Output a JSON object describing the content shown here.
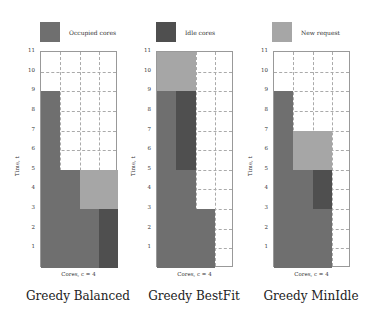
{
  "colors": {
    "occupied": "#6f6f6f",
    "idle": "#4f4f4f",
    "new_request": "#a6a6a6",
    "grid": "#aaaaaa"
  },
  "legend": [
    {
      "key": "occupied",
      "label": "Occupied cores"
    },
    {
      "key": "idle",
      "label": "Idle cores"
    },
    {
      "key": "new_request",
      "label": "New request"
    }
  ],
  "axes": {
    "y_ticks": [
      "1",
      "2",
      "3",
      "4",
      "5",
      "6",
      "7",
      "8",
      "9",
      "10",
      "11"
    ],
    "y_label": "Time, t",
    "x_label": "Cores, c = 4",
    "y_range": [
      0,
      11
    ],
    "cores": 4
  },
  "charts": [
    {
      "title": "Greedy Balanced",
      "blocks": [
        {
          "type": "occupied",
          "core": 1,
          "from": 0,
          "to": 9
        },
        {
          "type": "occupied",
          "core": 2,
          "from": 0,
          "to": 5
        },
        {
          "type": "occupied",
          "core": 3,
          "from": 0,
          "to": 3
        },
        {
          "type": "idle",
          "core": 4,
          "from": 0,
          "to": 3
        },
        {
          "type": "new_request",
          "core": 3,
          "from": 3,
          "to": 5
        },
        {
          "type": "new_request",
          "core": 4,
          "from": 3,
          "to": 5
        }
      ]
    },
    {
      "title": "Greedy BestFit",
      "blocks": [
        {
          "type": "occupied",
          "core": 1,
          "from": 0,
          "to": 9
        },
        {
          "type": "occupied",
          "core": 2,
          "from": 0,
          "to": 5
        },
        {
          "type": "idle",
          "core": 2,
          "from": 5,
          "to": 9
        },
        {
          "type": "occupied",
          "core": 3,
          "from": 0,
          "to": 3
        },
        {
          "type": "new_request",
          "core": 1,
          "from": 9,
          "to": 11
        },
        {
          "type": "new_request",
          "core": 2,
          "from": 9,
          "to": 11
        }
      ]
    },
    {
      "title": "Greedy MinIdle",
      "blocks": [
        {
          "type": "occupied",
          "core": 1,
          "from": 0,
          "to": 9
        },
        {
          "type": "occupied",
          "core": 2,
          "from": 0,
          "to": 5
        },
        {
          "type": "occupied",
          "core": 3,
          "from": 0,
          "to": 3
        },
        {
          "type": "idle",
          "core": 3,
          "from": 3,
          "to": 5
        },
        {
          "type": "new_request",
          "core": 2,
          "from": 5,
          "to": 7
        },
        {
          "type": "new_request",
          "core": 3,
          "from": 5,
          "to": 7
        }
      ]
    }
  ]
}
